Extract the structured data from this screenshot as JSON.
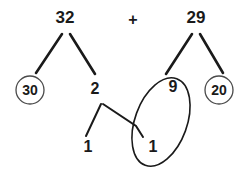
{
  "diagram": {
    "type": "number-bond-decomposition",
    "title_text": "",
    "operator": "+",
    "addends": [
      {
        "id": "left",
        "value": "32",
        "x": 65,
        "y": 19
      },
      {
        "id": "right",
        "value": "29",
        "x": 196,
        "y": 19
      }
    ],
    "operator_pos": {
      "x": 133,
      "y": 21
    },
    "nodes": [
      {
        "id": "left-tens",
        "label": "30",
        "circled": true,
        "x": 30,
        "y": 90,
        "r": 14
      },
      {
        "id": "left-ones",
        "label": "2",
        "circled": false,
        "x": 95,
        "y": 90
      },
      {
        "id": "right-tens",
        "label": "9",
        "circled": false,
        "x": 173,
        "y": 88
      },
      {
        "id": "right-ones",
        "label": "20",
        "circled": true,
        "x": 219,
        "y": 90,
        "r": 14
      },
      {
        "id": "split-left-one",
        "label": "1",
        "circled": false,
        "x": 88,
        "y": 148
      },
      {
        "id": "split-right-one",
        "label": "1",
        "circled": false,
        "x": 153,
        "y": 148
      }
    ],
    "branches": [
      {
        "id": "b32-30",
        "from": "32",
        "to": "30",
        "x1": 62,
        "y1": 34,
        "x2": 36,
        "y2": 73
      },
      {
        "id": "b32-2",
        "from": "32",
        "to": "2",
        "x1": 70,
        "y1": 34,
        "x2": 95,
        "y2": 74
      },
      {
        "id": "b29-9",
        "from": "29",
        "to": "9",
        "x1": 192,
        "y1": 34,
        "x2": 166,
        "y2": 74
      },
      {
        "id": "b29-20",
        "from": "29",
        "to": "20",
        "x1": 200,
        "y1": 34,
        "x2": 223,
        "y2": 73
      },
      {
        "id": "b2-1",
        "from": "2",
        "to": "1",
        "x1": 101,
        "y1": 104,
        "x2": 86,
        "y2": 136
      },
      {
        "id": "b2-1r",
        "from": "2",
        "to": "1r",
        "x1": 103,
        "y1": 104,
        "x2": 136,
        "y2": 126
      },
      {
        "id": "b1r-tail",
        "from": "1r",
        "to": "ellipse",
        "x1": 136,
        "y1": 126,
        "x2": 142,
        "y2": 136
      }
    ],
    "lasso": {
      "id": "grouping-ellipse",
      "groups": [
        "9",
        "1"
      ],
      "cx": 161,
      "cy": 122,
      "rx": 26,
      "ry": 46,
      "rotation": 20
    },
    "colors": {
      "ink": "#1a1a1a",
      "ring": "#4a4a4a",
      "background": "#ffffff"
    }
  }
}
